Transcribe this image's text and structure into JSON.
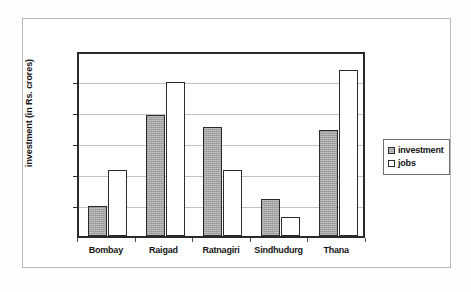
{
  "chart_data": {
    "type": "bar",
    "title": "",
    "xlabel": "",
    "ylabel": "investment (in Rs. crores)",
    "ylim": [
      0,
      30000
    ],
    "ytick_labels": [
      "30000",
      "25000",
      "20000",
      "15000",
      "10000",
      "5000",
      "0"
    ],
    "ytick_values": [
      30000,
      25000,
      20000,
      15000,
      10000,
      5000,
      0
    ],
    "grid": true,
    "legend_position": "right",
    "categories": [
      "Bombay",
      "Raigad",
      "Ratnagiri",
      "Sindhudurg",
      "Thana"
    ],
    "series": [
      {
        "name": "investment",
        "color": "#a6a6a6",
        "values": [
          5000,
          19600,
          17800,
          6200,
          17300
        ]
      },
      {
        "name": "jobs",
        "color": "#ffffff",
        "values": [
          10800,
          25000,
          10800,
          3200,
          26900
        ]
      }
    ]
  },
  "legend": {
    "items": [
      {
        "label": "investment",
        "marker": "filled-gray-square"
      },
      {
        "label": "jobs",
        "marker": "white-square"
      }
    ]
  }
}
